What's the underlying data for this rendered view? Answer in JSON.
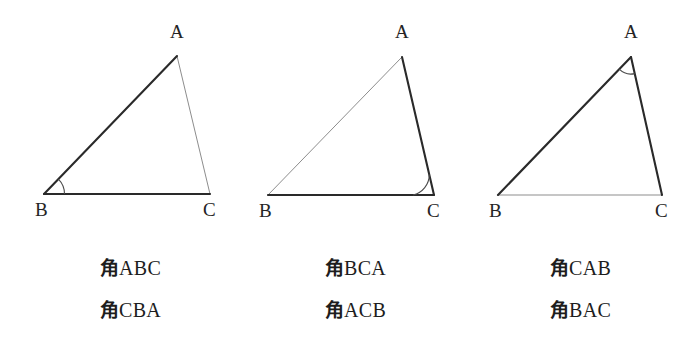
{
  "figure": {
    "background_color": "#ffffff",
    "thick_stroke_color": "#2a2a2a",
    "thin_stroke_color": "#8d8d8d",
    "thick_stroke_width": 2.1,
    "thin_stroke_width": 1.0,
    "vertex_label_color": "#242424",
    "triangles": [
      {
        "name": "triangle-angle-b",
        "highlighted_vertex": "B",
        "arc_radius": 21,
        "vertices": {
          "A": {
            "label": "A",
            "x": 177,
            "y": 56,
            "label_x": 170,
            "label_y": 22
          },
          "B": {
            "label": "B",
            "x": 44,
            "y": 194,
            "label_x": 35,
            "label_y": 200
          },
          "C": {
            "label": "C",
            "x": 210,
            "y": 194,
            "label_x": 203,
            "label_y": 200
          }
        },
        "thick_sides": [
          "B-A",
          "B-C"
        ],
        "thin_sides": [
          "A-C"
        ],
        "labels": [
          "角ABC",
          "角CBA"
        ]
      },
      {
        "name": "triangle-angle-c",
        "highlighted_vertex": "C",
        "arc_radius": 21,
        "vertices": {
          "A": {
            "label": "A",
            "x": 402,
            "y": 57,
            "label_x": 395,
            "label_y": 22
          },
          "B": {
            "label": "B",
            "x": 268,
            "y": 195,
            "label_x": 259,
            "label_y": 201
          },
          "C": {
            "label": "C",
            "x": 434,
            "y": 195,
            "label_x": 427,
            "label_y": 201
          }
        },
        "thick_sides": [
          "C-B",
          "C-A"
        ],
        "thin_sides": [
          "A-B"
        ],
        "labels": [
          "角BCA",
          "角ACB"
        ]
      },
      {
        "name": "triangle-angle-a",
        "highlighted_vertex": "A",
        "arc_radius": 17,
        "vertices": {
          "A": {
            "label": "A",
            "x": 631,
            "y": 57,
            "label_x": 624,
            "label_y": 22
          },
          "B": {
            "label": "B",
            "x": 498,
            "y": 195,
            "label_x": 489,
            "label_y": 201
          },
          "C": {
            "label": "C",
            "x": 662,
            "y": 195,
            "label_x": 655,
            "label_y": 201
          }
        },
        "thick_sides": [
          "A-B",
          "A-C"
        ],
        "thin_sides": [
          "B-C"
        ],
        "labels": [
          "角CAB",
          "角BAC"
        ]
      }
    ]
  },
  "captions": {
    "column_1": {
      "cjk": "角",
      "top_letters": "ABC",
      "bottom_letters": "CBA",
      "top": "角ABC",
      "bottom": "角CBA"
    },
    "column_2": {
      "cjk": "角",
      "top_letters": "BCA",
      "bottom_letters": "ACB",
      "top": "角BCA",
      "bottom": "角ACB"
    },
    "column_3": {
      "cjk": "角",
      "top_letters": "CAB",
      "bottom_letters": "BAC",
      "top": "角CAB",
      "bottom": "角BAC"
    }
  },
  "vertex_letters": {
    "a": "A",
    "b": "B",
    "c": "C"
  }
}
